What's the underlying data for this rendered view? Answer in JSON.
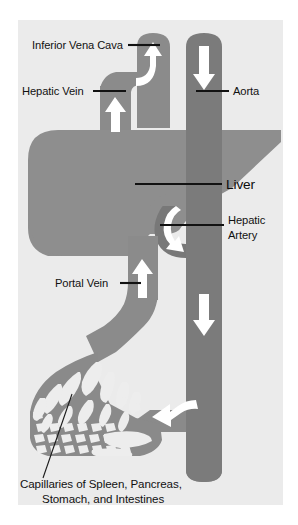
{
  "figure": {
    "panel": {
      "background_color": "#eeeeee",
      "page_color": "#ffffff",
      "x": 18,
      "y": 20,
      "width": 265,
      "height": 485
    },
    "colors": {
      "liver_fill": "#8e8e8e",
      "vein_fill": "#8b8b8b",
      "artery_fill": "#787878",
      "aorta_fill": "#7b7b7b",
      "capillary_fill": "#8a8a8a",
      "arrow_fill": "#ffffff",
      "label_text": "#111111",
      "leader_line": "#121212"
    },
    "labels": [
      {
        "id": "inferior-vena-cava",
        "text": "Inferior Vena Cava",
        "x": 32,
        "y": 49,
        "anchor": "start",
        "leader": {
          "x1": 128,
          "y1": 45,
          "x2": 160,
          "y2": 45
        }
      },
      {
        "id": "hepatic-vein",
        "text": "Hepatic Vein",
        "x": 22,
        "y": 95,
        "anchor": "start",
        "leader": {
          "x1": 93,
          "y1": 91,
          "x2": 126,
          "y2": 91
        }
      },
      {
        "id": "aorta",
        "text": "Aorta",
        "x": 233,
        "y": 95,
        "anchor": "start",
        "leader": {
          "x1": 196,
          "y1": 91,
          "x2": 229,
          "y2": 91
        }
      },
      {
        "id": "liver",
        "text": "Liver",
        "x": 226,
        "y": 189,
        "anchor": "start",
        "leader": {
          "x1": 135,
          "y1": 184,
          "x2": 222,
          "y2": 184
        }
      },
      {
        "id": "hepatic-artery",
        "text": "Hepatic",
        "text2": "Artery",
        "x": 228,
        "y": 224,
        "x2": 228,
        "y2": 239,
        "anchor": "start",
        "leader": {
          "x1": 160,
          "y1": 225,
          "x2": 224,
          "y2": 225
        }
      },
      {
        "id": "portal-vein",
        "text": "Portal Vein",
        "x": 55,
        "y": 287,
        "anchor": "start",
        "leader": {
          "x1": 120,
          "y1": 283,
          "x2": 141,
          "y2": 283
        }
      }
    ],
    "caption": {
      "id": "capillaries-caption",
      "line1": "Capillaries of Spleen, Pancreas,",
      "line2": "Stomach, and Intestines",
      "line1_x": 20,
      "line1_y": 488,
      "line2_x": 42,
      "line2_y": 503,
      "leader": {
        "x1": 43,
        "y1": 478,
        "x2": 72,
        "y2": 394
      }
    },
    "vessels": [
      {
        "id": "inferior-vena-cava-vessel",
        "name": "Inferior Vena Cava"
      },
      {
        "id": "hepatic-vein-vessel",
        "name": "Hepatic Vein"
      },
      {
        "id": "aorta-vessel",
        "name": "Aorta"
      },
      {
        "id": "hepatic-artery-vessel",
        "name": "Hepatic Artery"
      },
      {
        "id": "portal-vein-vessel",
        "name": "Portal Vein"
      },
      {
        "id": "capillary-bed",
        "name": "Capillary Bed"
      },
      {
        "id": "liver-organ",
        "name": "Liver"
      }
    ],
    "flow_arrows": [
      {
        "id": "ivc-arrow",
        "direction": "up-curved",
        "vessel": "Inferior Vena Cava"
      },
      {
        "id": "aorta-top-arrow",
        "direction": "down",
        "vessel": "Aorta"
      },
      {
        "id": "hepatic-vein-arrow",
        "direction": "up",
        "vessel": "Hepatic Vein"
      },
      {
        "id": "hepatic-artery-arrow",
        "direction": "down-curved",
        "vessel": "Hepatic Artery"
      },
      {
        "id": "portal-vein-arrow",
        "direction": "up",
        "vessel": "Portal Vein"
      },
      {
        "id": "aorta-lower-arrow",
        "direction": "down",
        "vessel": "Aorta"
      },
      {
        "id": "mesenteric-arrow",
        "direction": "left-curved",
        "vessel": "Mesenteric Artery"
      }
    ]
  }
}
